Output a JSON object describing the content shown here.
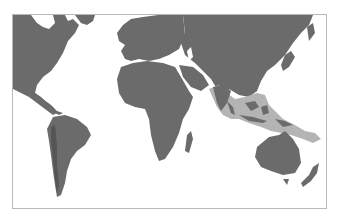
{
  "map": {
    "title": "World map with highlighted Indo-Pacific region",
    "projection": "Equirectangular (Pacific-cropped)",
    "colors": {
      "ocean": "#ffffff",
      "land": "#6b6b6b",
      "land_shade": "#555555",
      "highlight_region": "#b4b4b4",
      "frame_border": "#b8b8b8"
    },
    "regions": [
      {
        "id": "north-america",
        "label": "North America"
      },
      {
        "id": "south-america",
        "label": "South America"
      },
      {
        "id": "europe",
        "label": "Europe"
      },
      {
        "id": "africa",
        "label": "Africa"
      },
      {
        "id": "asia",
        "label": "Asia"
      },
      {
        "id": "australia",
        "label": "Australia"
      },
      {
        "id": "new-zealand",
        "label": "New Zealand"
      },
      {
        "id": "indo-pacific-highlight",
        "label": "Highlighted Indo-Pacific / South & Southeast Asia region"
      }
    ]
  }
}
